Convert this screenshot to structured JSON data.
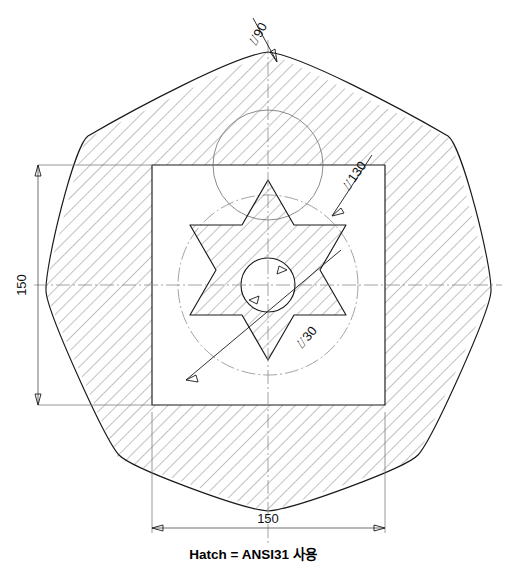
{
  "drawing": {
    "title": "Hexagram plate technical drawing",
    "caption": "Hatch = ANSI31 사용",
    "units": "mm",
    "background_color": "#ffffff",
    "line_color": "#1a1a1a",
    "hatch_color": "#3b3b3b",
    "centerline_color": "#8c8c8c"
  },
  "dimensions": {
    "height_label": "150",
    "width_label": "150",
    "polygon_circle_label": "⌰90",
    "star_circle_label": "⌰130",
    "center_hole_label": "⌰30"
  },
  "geometry": {
    "center": {
      "x": 268,
      "y": 285
    },
    "square": {
      "left": 152,
      "top": 165,
      "right": 385,
      "bottom": 405
    },
    "outer_polygon_sides": 7,
    "outer_polygon_radius": 222,
    "star_points": 6,
    "star_outer_diameter": 130,
    "star_inner_diameter": 60,
    "center_hole_diameter": 30,
    "polygon_construction_diameter": 90
  },
  "labels": {
    "hatch_pattern": "ANSI31",
    "hatch_angle_deg": 45,
    "hatch_spacing_px": 9
  }
}
